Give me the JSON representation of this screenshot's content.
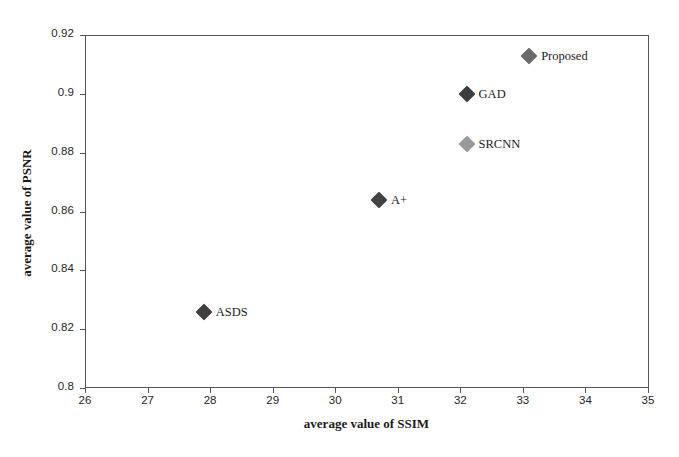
{
  "chart_data": {
    "type": "scatter",
    "title": "",
    "xlabel": "average value of SSIM",
    "ylabel": "average value of PSNR",
    "xlim": [
      26,
      35
    ],
    "ylim": [
      0.8,
      0.92
    ],
    "xticks": [
      "26",
      "27",
      "28",
      "29",
      "30",
      "31",
      "32",
      "33",
      "34",
      "35"
    ],
    "yticks": [
      "0.92",
      "0.9",
      "0.88",
      "0.86",
      "0.84",
      "0.82",
      "0.8"
    ],
    "grid": false,
    "legend": "none (point labels inline)",
    "points": [
      {
        "label": "ASDS",
        "x": 27.9,
        "y": 0.826,
        "color": "#3f3f3f"
      },
      {
        "label": "A+",
        "x": 30.7,
        "y": 0.864,
        "color": "#434343"
      },
      {
        "label": "SRCNN",
        "x": 32.1,
        "y": 0.883,
        "color": "#9a9a9a"
      },
      {
        "label": "GAD",
        "x": 32.1,
        "y": 0.9,
        "color": "#3d3d3d"
      },
      {
        "label": "Proposed",
        "x": 33.1,
        "y": 0.913,
        "color": "#6b6b6b"
      }
    ]
  },
  "axis_color": "#555555",
  "background": "#ffffff"
}
